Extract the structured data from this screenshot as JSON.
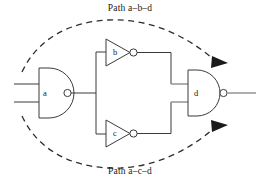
{
  "figure": {
    "type": "logic-circuit-diagram",
    "background_color": "#ffffff",
    "line_color": "#3b3b3b",
    "highlight_color": "#9a9a9a",
    "width": 260,
    "height": 186
  },
  "labels": {
    "top_path": "Path a–b–d",
    "bottom_path": "Path a–c–d"
  },
  "gates": [
    {
      "id": "a",
      "label": "a",
      "kind": "nand-gate",
      "inputs": 2,
      "has_bubble": true
    },
    {
      "id": "b",
      "label": "b",
      "kind": "inverter",
      "inputs": 1,
      "has_bubble": true
    },
    {
      "id": "c",
      "label": "c",
      "kind": "inverter",
      "inputs": 1,
      "has_bubble": true
    },
    {
      "id": "d",
      "label": "d",
      "kind": "nand-gate",
      "inputs": 2,
      "has_bubble": true
    }
  ],
  "paths": [
    {
      "name": "Path a–b–d",
      "route": [
        "a",
        "b",
        "d"
      ],
      "position": "top",
      "style": "dashed",
      "terminates_with_arrow": true
    },
    {
      "name": "Path a–c–d",
      "route": [
        "a",
        "c",
        "d"
      ],
      "position": "bottom",
      "style": "dashed",
      "terminates_with_arrow": true
    }
  ],
  "nets": [
    {
      "name": "input-1",
      "from": "external",
      "to": "a"
    },
    {
      "name": "input-2",
      "from": "external",
      "to": "a"
    },
    {
      "name": "a-out",
      "from": "a",
      "to": [
        "b",
        "c"
      ]
    },
    {
      "name": "b-out",
      "from": "b",
      "to": "d"
    },
    {
      "name": "c-out",
      "from": "c",
      "to": "d"
    },
    {
      "name": "d-out",
      "from": "d",
      "to": "external"
    }
  ]
}
